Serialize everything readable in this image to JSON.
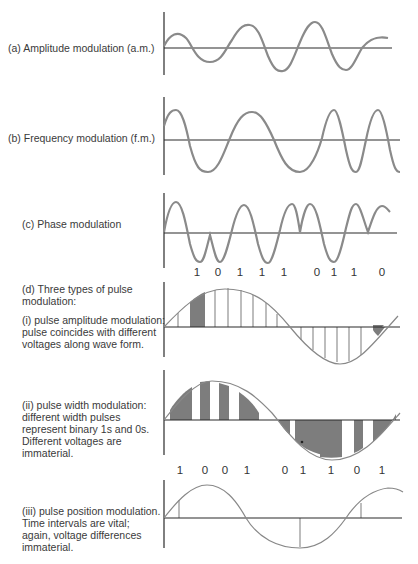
{
  "panels": {
    "a": {
      "label": "(a) Amplitude modulation (a.m.)"
    },
    "b": {
      "label": "(b) Frequency modulation (f.m.)"
    },
    "c": {
      "label": "(c) Phase modulation",
      "bits": [
        "1",
        "0",
        "1",
        "1",
        "1",
        "0",
        "1",
        "1",
        "0"
      ]
    },
    "d": {
      "heading": "(d) Three types of pulse modulation:",
      "heading_line1": "(d) Three types of pulse",
      "heading_line2": "modulation:",
      "i": {
        "line1": "(i) pulse amplitude modulation:",
        "line2": "pulse coincides with different",
        "line3": "voltages along wave form."
      },
      "ii": {
        "line1": "(ii) pulse width modulation:",
        "line2": "different width pulses",
        "line3": "represent binary 1s and 0s.",
        "line4": "Different voltages are",
        "line5": "immaterial.",
        "bits": [
          "1",
          "0",
          "0",
          "1",
          "0",
          "1",
          "1",
          "0",
          "1"
        ]
      },
      "iii": {
        "line1": "(iii) pulse position modulation.",
        "line2": "Time intervals are vital;",
        "line3": "again, voltage differences",
        "line4": "immaterial."
      }
    }
  },
  "colors": {
    "wave": "#8a8a8a",
    "axis": "#2a2a2a",
    "pulse_fill": "#7d7d7d",
    "pulse_line": "#bdbdbd"
  }
}
